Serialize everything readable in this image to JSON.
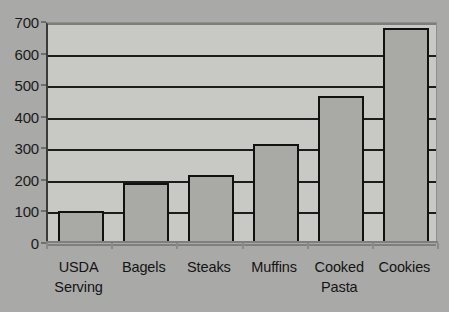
{
  "chart_data": {
    "type": "bar",
    "title": "",
    "xlabel": "",
    "ylabel": "",
    "categories": [
      "USDA\nServing",
      "Bagels",
      "Steaks",
      "Muffins",
      "Cooked\nPasta",
      "Cookies"
    ],
    "values": [
      100,
      190,
      215,
      313,
      465,
      680
    ],
    "ylim": [
      0,
      700
    ],
    "ytick_labels": [
      "700",
      "600",
      "500",
      "400",
      "300",
      "200",
      "100",
      "0"
    ],
    "ytick_values": [
      700,
      600,
      500,
      400,
      300,
      200,
      100,
      0
    ],
    "grid": true,
    "legend": false,
    "legend_position": "none",
    "colors": {
      "background": "#a9a9a7",
      "plot_background": "#c8c8c5",
      "bar_fill": "#a9a9a6",
      "bar_border": "#111111",
      "gridline": "#1c1c1c",
      "text": "#141414"
    }
  }
}
